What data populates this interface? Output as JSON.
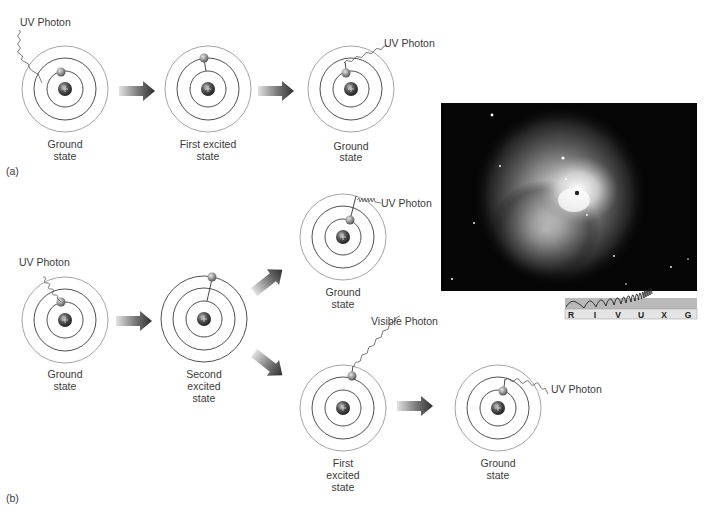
{
  "figure": {
    "panels": [
      {
        "label": "(a)",
        "atoms": [
          {
            "caption_lines": [
              "Ground",
              "state"
            ],
            "photon_label": "UV Photon"
          },
          {
            "caption_lines": [
              "First excited",
              "state"
            ]
          },
          {
            "caption_lines": [
              "Ground",
              "state"
            ],
            "photon_label": "UV Photon"
          }
        ]
      },
      {
        "label": "(b)",
        "atoms": [
          {
            "caption_lines": [
              "Ground",
              "state"
            ],
            "photon_label": "UV Photon"
          },
          {
            "caption_lines": [
              "Second",
              "excited",
              "state"
            ]
          },
          {
            "caption_lines": [
              "Ground",
              "state"
            ],
            "photon_label": "UV Photon"
          },
          {
            "caption_lines": [
              "First",
              "excited",
              "state"
            ],
            "photon_label": "Visible Photon"
          },
          {
            "caption_lines": [
              "Ground",
              "state"
            ],
            "photon_label": "UV Photon"
          }
        ]
      }
    ],
    "nucleus_symbol": "+",
    "spectrum_bar": {
      "bands": [
        "R",
        "I",
        "V",
        "U",
        "X",
        "G"
      ],
      "highlighted": "X"
    },
    "colors": {
      "ring_outer": "#9a9a9a",
      "ring_inner": "#3c3c3c",
      "arrow_dark": "#333333",
      "arrow_light": "#dcdcdc",
      "nebula_bg": "#050505"
    }
  }
}
